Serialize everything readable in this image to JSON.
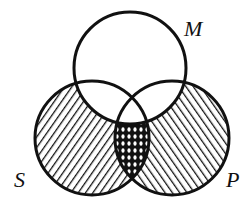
{
  "diagram": {
    "type": "venn",
    "sets": [
      {
        "id": "M",
        "label": "M",
        "cx": 130,
        "cy": 68,
        "r": 56,
        "shading": "none"
      },
      {
        "id": "S",
        "label": "S",
        "cx": 92,
        "cy": 138,
        "r": 57,
        "shading": "diagonal-hatch-forward"
      },
      {
        "id": "P",
        "label": "P",
        "cx": 172,
        "cy": 138,
        "r": 57,
        "shading": "diagonal-hatch-backward"
      }
    ],
    "regions": [
      {
        "name": "S outside M",
        "shading": "hatched /"
      },
      {
        "name": "P outside M",
        "shading": "hatched \\"
      },
      {
        "name": "S and P outside M",
        "shading": "cross-hatched"
      },
      {
        "name": "inside M",
        "shading": "unshaded"
      }
    ],
    "colors": {
      "stroke": "#111111",
      "background": "#ffffff"
    }
  }
}
